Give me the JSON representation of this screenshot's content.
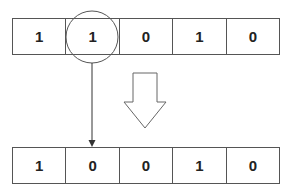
{
  "diagram": {
    "before": {
      "bits": [
        "1",
        "1",
        "0",
        "1",
        "0"
      ]
    },
    "after": {
      "bits": [
        "1",
        "0",
        "0",
        "1",
        "0"
      ]
    },
    "highlighted_index": 1,
    "colors": {
      "stroke": "#555555",
      "text": "#222222",
      "background": "#ffffff"
    }
  }
}
